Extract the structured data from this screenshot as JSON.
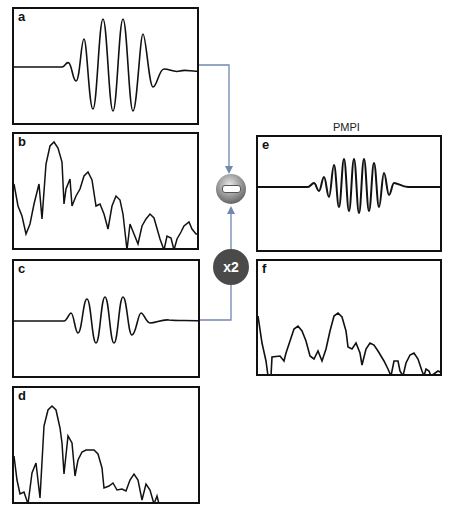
{
  "figure": {
    "title_e": "PMPI",
    "panels": [
      {
        "id": "a",
        "label": "a",
        "type": "time-domain waveform"
      },
      {
        "id": "b",
        "label": "b",
        "type": "frequency spectrum"
      },
      {
        "id": "c",
        "label": "c",
        "type": "time-domain waveform"
      },
      {
        "id": "d",
        "label": "d",
        "type": "frequency spectrum"
      },
      {
        "id": "e",
        "label": "e",
        "type": "time-domain waveform (result)"
      },
      {
        "id": "f",
        "label": "f",
        "type": "frequency spectrum (result)"
      }
    ],
    "operators": {
      "subtract": {
        "symbol": "minus",
        "color": "#5a5a5a"
      },
      "multiply": {
        "label": "x2",
        "color": "#4a4a4a"
      }
    },
    "colors": {
      "connector": "#7088b0",
      "frame": "#111111"
    }
  }
}
